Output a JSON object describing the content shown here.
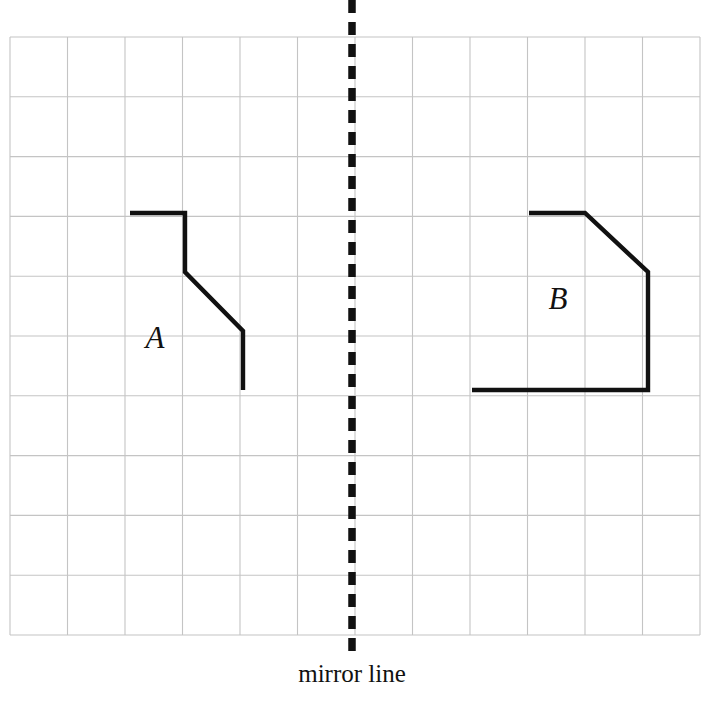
{
  "figure": {
    "caption": "mirror line",
    "background_color": "#ffffff",
    "ink_color": "#111111",
    "grid_color": "#c4c4c4"
  },
  "grid": {
    "x0": 10,
    "y0": 37,
    "x1": 700,
    "y1": 635,
    "columns": 12,
    "rows": 10,
    "cell_width": 57.5,
    "cell_height": 59.8
  },
  "mirror": {
    "label": "mirror line",
    "x": 352,
    "y_top": 0,
    "y_bottom": 657,
    "dash": 13,
    "gap": 9,
    "width": 7.5,
    "label_x": 352,
    "label_y": 660
  },
  "shapes": [
    {
      "name": "A",
      "label": "A",
      "label_x": 155,
      "label_y": 348,
      "closed": false,
      "points": "130,213 185,213 185,272 243,331 243,390"
    },
    {
      "name": "B",
      "label": "B",
      "label_x": 558,
      "label_y": 309,
      "closed": false,
      "points": "472,390 648,390 648,272 585,213 529,213"
    }
  ],
  "chart_data": {
    "type": "diagram",
    "grid": {
      "columns": 12,
      "rows": 10,
      "origin_pixel": [
        10,
        37
      ],
      "cell_pixel": [
        57.5,
        59.8
      ]
    },
    "mirror_line": {
      "orientation": "vertical",
      "pixel_x": 352,
      "grid_column_index": 6,
      "label": "mirror line",
      "style": "dashed"
    },
    "series": [
      {
        "name": "A",
        "label": "A",
        "grid_vertices": [
          [
            2.09,
            2.94
          ],
          [
            3.04,
            2.94
          ],
          [
            3.04,
            3.93
          ],
          [
            4.05,
            4.92
          ],
          [
            4.05,
            5.9
          ]
        ],
        "pixel_vertices": [
          [
            130,
            213
          ],
          [
            185,
            213
          ],
          [
            185,
            272
          ],
          [
            243,
            331
          ],
          [
            243,
            390
          ]
        ],
        "closed": false
      },
      {
        "name": "B",
        "label": "B",
        "grid_vertices": [
          [
            8.03,
            5.9
          ],
          [
            11.1,
            5.9
          ],
          [
            11.1,
            3.93
          ],
          [
            10.0,
            2.94
          ],
          [
            9.03,
            2.94
          ]
        ],
        "pixel_vertices": [
          [
            472,
            390
          ],
          [
            648,
            390
          ],
          [
            648,
            272
          ],
          [
            585,
            213
          ],
          [
            529,
            213
          ]
        ],
        "closed": false
      }
    ],
    "legend": [
      "A",
      "B"
    ],
    "xlabel": "",
    "ylabel": "",
    "grid_on": true
  }
}
